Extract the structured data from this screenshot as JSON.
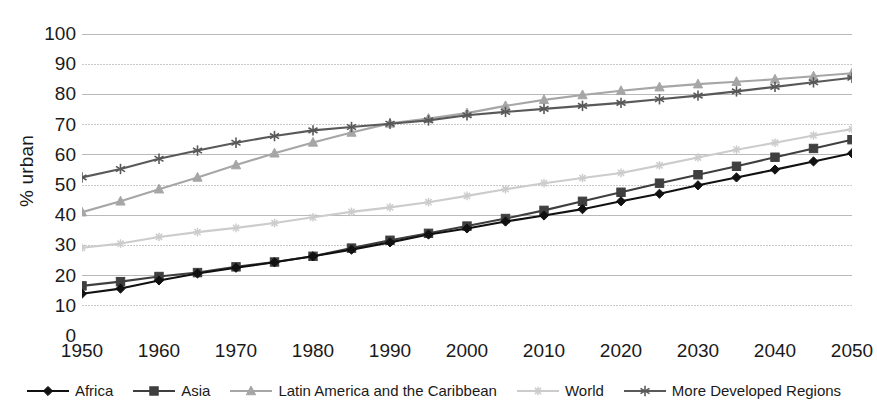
{
  "caption_remnant": "",
  "axes": {
    "ylabel": "% urban",
    "xlabel": ""
  },
  "chart_data": {
    "type": "line",
    "title": "",
    "xlabel": "",
    "ylabel": "% urban",
    "xlim": [
      1950,
      2050
    ],
    "ylim": [
      0,
      100
    ],
    "xticks": [
      1950,
      1960,
      1970,
      1980,
      1990,
      2000,
      2010,
      2020,
      2030,
      2040,
      2050
    ],
    "yticks": [
      0,
      10,
      20,
      30,
      40,
      50,
      60,
      70,
      80,
      90,
      100
    ],
    "grid": "horizontal",
    "legend_position": "bottom",
    "x": [
      1950,
      1955,
      1960,
      1965,
      1970,
      1975,
      1980,
      1985,
      1990,
      1995,
      2000,
      2005,
      2010,
      2015,
      2020,
      2025,
      2030,
      2035,
      2040,
      2045,
      2050
    ],
    "series": [
      {
        "name": "Africa",
        "color": "#111111",
        "marker": "diamond",
        "values": [
          14.0,
          15.7,
          18.4,
          20.7,
          22.6,
          24.4,
          26.4,
          28.6,
          31.0,
          33.6,
          35.6,
          37.9,
          39.9,
          42.0,
          44.6,
          47.1,
          49.9,
          52.5,
          55.1,
          57.8,
          60.5
        ]
      },
      {
        "name": "Asia",
        "color": "#3f3f3f",
        "marker": "square",
        "values": [
          16.6,
          18.0,
          19.7,
          21.0,
          22.9,
          24.5,
          26.4,
          29.1,
          31.7,
          34.0,
          36.4,
          38.9,
          41.6,
          44.6,
          47.6,
          50.6,
          53.4,
          56.2,
          59.2,
          62.1,
          65.0
        ]
      },
      {
        "name": "Latin America and the Caribbean",
        "color": "#a6a6a6",
        "marker": "triangle",
        "values": [
          41.0,
          44.6,
          48.6,
          52.5,
          56.6,
          60.5,
          64.1,
          67.4,
          70.4,
          72.0,
          73.8,
          76.2,
          78.2,
          79.8,
          81.2,
          82.4,
          83.4,
          84.2,
          85.0,
          86.0,
          87.0
        ]
      },
      {
        "name": "World",
        "color": "#cccccc",
        "marker": "cross",
        "values": [
          29.2,
          30.6,
          32.8,
          34.4,
          35.8,
          37.4,
          39.3,
          41.1,
          42.6,
          44.3,
          46.4,
          48.6,
          50.6,
          52.3,
          54.0,
          56.5,
          59.1,
          61.7,
          64.0,
          66.4,
          68.5
        ]
      },
      {
        "name": "More Developed Regions",
        "color": "#595959",
        "marker": "asterisk",
        "values": [
          52.5,
          55.3,
          58.7,
          61.4,
          64.0,
          66.2,
          68.1,
          69.2,
          70.3,
          71.4,
          73.1,
          74.2,
          75.2,
          76.2,
          77.2,
          78.4,
          79.6,
          81.0,
          82.5,
          84.0,
          85.5
        ]
      }
    ]
  },
  "legend": {
    "items": [
      {
        "label": "Africa",
        "color": "#111111",
        "marker": "diamond"
      },
      {
        "label": "Asia",
        "color": "#3f3f3f",
        "marker": "square"
      },
      {
        "label": "Latin America and the Caribbean",
        "color": "#a6a6a6",
        "marker": "triangle"
      },
      {
        "label": "World",
        "color": "#cccccc",
        "marker": "cross"
      },
      {
        "label": "More Developed Regions",
        "color": "#595959",
        "marker": "asterisk"
      }
    ]
  }
}
